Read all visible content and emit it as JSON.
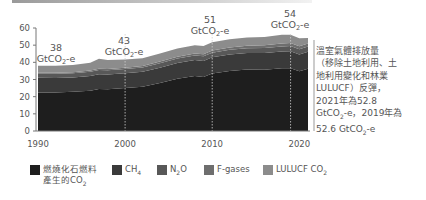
{
  "chart_data": {
    "type": "area",
    "stacked": true,
    "title": "",
    "xlabel": "",
    "ylabel": "",
    "ylim": [
      0,
      60
    ],
    "xlim": [
      1990,
      2021
    ],
    "y_ticks": [
      "0",
      "10",
      "20",
      "30",
      "40",
      "50",
      "60"
    ],
    "x_ticks": [
      "1990",
      "2000",
      "2010",
      "2020"
    ],
    "x": [
      1990,
      1992,
      1994,
      1996,
      1997,
      1998,
      2000,
      2002,
      2004,
      2006,
      2008,
      2009,
      2010,
      2012,
      2014,
      2016,
      2018,
      2019,
      2020,
      2021
    ],
    "series": [
      {
        "name": "燃燒化石燃料產生的CO2",
        "color": "#1e1e1e",
        "values": [
          22.5,
          22.5,
          22.8,
          23.5,
          24.5,
          24.3,
          25.0,
          25.8,
          28.0,
          30.5,
          32.0,
          31.5,
          33.5,
          35.0,
          35.8,
          35.7,
          36.5,
          36.6,
          34.8,
          36.3
        ]
      },
      {
        "name": "CH4",
        "color": "#3a3a3a",
        "values": [
          8.5,
          8.4,
          8.4,
          8.5,
          8.6,
          8.6,
          8.6,
          8.7,
          8.9,
          9.1,
          9.3,
          9.3,
          9.4,
          9.5,
          9.6,
          9.7,
          9.8,
          9.9,
          9.8,
          9.9
        ]
      },
      {
        "name": "N2O",
        "color": "#585858",
        "values": [
          2.4,
          2.4,
          2.4,
          2.5,
          2.5,
          2.5,
          2.5,
          2.5,
          2.6,
          2.6,
          2.7,
          2.7,
          2.7,
          2.8,
          2.8,
          2.9,
          2.9,
          3.0,
          3.0,
          3.0
        ]
      },
      {
        "name": "F-gases",
        "color": "#6e6e6e",
        "values": [
          0.6,
          0.6,
          0.6,
          0.7,
          0.7,
          0.7,
          0.8,
          0.9,
          1.0,
          1.1,
          1.2,
          1.2,
          1.3,
          1.4,
          1.5,
          1.6,
          1.7,
          1.7,
          1.7,
          1.8
        ]
      },
      {
        "name": "LULUCF CO2",
        "color": "#8c8c8c",
        "values": [
          4.0,
          4.1,
          4.3,
          4.6,
          5.8,
          5.3,
          4.8,
          4.5,
          4.7,
          4.8,
          4.8,
          4.8,
          4.8,
          4.8,
          4.8,
          4.8,
          5.1,
          4.8,
          4.7,
          3.2
        ]
      }
    ],
    "annotations": [
      {
        "year": 1990,
        "value": "38",
        "unit": "GtCO2-e"
      },
      {
        "year": 2000,
        "value": "43",
        "unit": "GtCO2-e"
      },
      {
        "year": 2010,
        "value": "51",
        "unit": "GtCO2-e"
      },
      {
        "year": 2019,
        "value": "54",
        "unit": "GtCO2-e"
      }
    ],
    "legend_position": "bottom"
  },
  "annotations": {
    "a1990": {
      "value": "38",
      "unit_pre": "GtCO",
      "unit_sub": "2",
      "unit_post": "-e"
    },
    "a2000": {
      "value": "43",
      "unit_pre": "GtCO",
      "unit_sub": "2",
      "unit_post": "-e"
    },
    "a2010": {
      "value": "51",
      "unit_pre": "GtCO",
      "unit_sub": "2",
      "unit_post": "-e"
    },
    "a2019": {
      "value": "54",
      "unit_pre": "GtCO",
      "unit_sub": "2",
      "unit_post": "-e"
    }
  },
  "note": {
    "line1": "溫室氣體排放量",
    "line2": "（移除土地利用、土",
    "line3": "地利用變化和林業",
    "line4": "LULUCF）反彈，",
    "line5": "2021年為52.8",
    "line6_pre": "GtCO",
    "line6_sub": "2",
    "line6_post": "-e，2019年為",
    "line7_pre": "52.6 GtCO",
    "line7_sub": "2",
    "line7_post": "-e"
  },
  "legend": [
    {
      "line1": "燃燒化石燃料",
      "line2_pre": "產生的CO",
      "line2_sub": "2",
      "color": "#1e1e1e"
    },
    {
      "pre": "CH",
      "sub": "4",
      "post": "",
      "color": "#3a3a3a"
    },
    {
      "pre": "N",
      "sub": "2",
      "post": "O",
      "color": "#585858"
    },
    {
      "pre": "F-gases",
      "sub": "",
      "post": "",
      "color": "#6e6e6e"
    },
    {
      "pre": "LULUCF CO",
      "sub": "2",
      "post": "",
      "color": "#8c8c8c"
    }
  ]
}
